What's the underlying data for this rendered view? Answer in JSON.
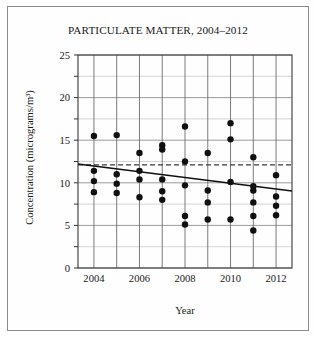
{
  "chart_data": {
    "type": "scatter",
    "title": "PARTICULATE MATTER, 2004–2012",
    "xlabel": "Year",
    "ylabel": "Concentration (micrograms/m³)",
    "xlim": [
      2003.3,
      2012.7
    ],
    "ylim": [
      0,
      25
    ],
    "grid": true,
    "legend": "none",
    "y_ticks_labeled": [
      0,
      5,
      10,
      15,
      20,
      25
    ],
    "y_gridlines": [
      0,
      2.5,
      5,
      7.5,
      10,
      12.5,
      15,
      17.5,
      20,
      22.5,
      25
    ],
    "x_ticks_labeled": [
      2004,
      2006,
      2008,
      2010,
      2012
    ],
    "x_gridlines": [
      2004,
      2005,
      2006,
      2007,
      2008,
      2009,
      2010,
      2011,
      2012
    ],
    "point_color": "#101010",
    "series": [
      {
        "name": "Annual measurements",
        "points": [
          {
            "x": 2004,
            "y": 15.5
          },
          {
            "x": 2004,
            "y": 11.4
          },
          {
            "x": 2004,
            "y": 10.2
          },
          {
            "x": 2004,
            "y": 8.9
          },
          {
            "x": 2005,
            "y": 15.6
          },
          {
            "x": 2005,
            "y": 11.0
          },
          {
            "x": 2005,
            "y": 9.9
          },
          {
            "x": 2005,
            "y": 8.8
          },
          {
            "x": 2006,
            "y": 13.5
          },
          {
            "x": 2006,
            "y": 11.4
          },
          {
            "x": 2006,
            "y": 10.4
          },
          {
            "x": 2006,
            "y": 8.3
          },
          {
            "x": 2007,
            "y": 14.4
          },
          {
            "x": 2007,
            "y": 13.9
          },
          {
            "x": 2007,
            "y": 10.4
          },
          {
            "x": 2007,
            "y": 9.0
          },
          {
            "x": 2007,
            "y": 8.0
          },
          {
            "x": 2008,
            "y": 16.6
          },
          {
            "x": 2008,
            "y": 12.5
          },
          {
            "x": 2008,
            "y": 9.7
          },
          {
            "x": 2008,
            "y": 6.1
          },
          {
            "x": 2008,
            "y": 5.1
          },
          {
            "x": 2009,
            "y": 13.5
          },
          {
            "x": 2009,
            "y": 9.1
          },
          {
            "x": 2009,
            "y": 7.7
          },
          {
            "x": 2009,
            "y": 5.7
          },
          {
            "x": 2010,
            "y": 17.0
          },
          {
            "x": 2010,
            "y": 15.1
          },
          {
            "x": 2010,
            "y": 10.1
          },
          {
            "x": 2010,
            "y": 5.7
          },
          {
            "x": 2011,
            "y": 13.0
          },
          {
            "x": 2011,
            "y": 9.6
          },
          {
            "x": 2011,
            "y": 9.1
          },
          {
            "x": 2011,
            "y": 7.7
          },
          {
            "x": 2011,
            "y": 6.1
          },
          {
            "x": 2011,
            "y": 4.4
          },
          {
            "x": 2012,
            "y": 10.9
          },
          {
            "x": 2012,
            "y": 8.4
          },
          {
            "x": 2012,
            "y": 7.3
          },
          {
            "x": 2012,
            "y": 6.2
          }
        ]
      }
    ],
    "reference_line": {
      "name": "standard-level",
      "style": "dashed",
      "color": "#3a3a3a",
      "y": 12.1
    },
    "trend_line": {
      "name": "linear-trend",
      "style": "solid",
      "color": "#101010",
      "x_start": 2003.3,
      "y_start": 12.2,
      "x_end": 2012.7,
      "y_end": 9.05
    }
  }
}
